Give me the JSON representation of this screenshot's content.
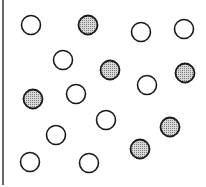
{
  "diagram": {
    "colors": {
      "stroke": "#1a1a1a",
      "open_fill": "#ffffff",
      "filled_fill": "#b0b0b0"
    },
    "circle_radius": 9.5,
    "circles": [
      {
        "x": 31,
        "y": 25,
        "type": "open"
      },
      {
        "x": 88,
        "y": 25,
        "type": "filled"
      },
      {
        "x": 141,
        "y": 32,
        "type": "open"
      },
      {
        "x": 184,
        "y": 29,
        "type": "open"
      },
      {
        "x": 63,
        "y": 60,
        "type": "open"
      },
      {
        "x": 110,
        "y": 70,
        "type": "filled"
      },
      {
        "x": 185,
        "y": 73,
        "type": "filled"
      },
      {
        "x": 33,
        "y": 99,
        "type": "filled"
      },
      {
        "x": 76,
        "y": 94,
        "type": "open"
      },
      {
        "x": 147,
        "y": 85,
        "type": "open"
      },
      {
        "x": 106,
        "y": 120,
        "type": "open"
      },
      {
        "x": 170,
        "y": 127,
        "type": "filled"
      },
      {
        "x": 56,
        "y": 135,
        "type": "open"
      },
      {
        "x": 140,
        "y": 149,
        "type": "filled"
      },
      {
        "x": 30,
        "y": 162,
        "type": "open"
      },
      {
        "x": 89,
        "y": 163,
        "type": "open"
      }
    ],
    "counts": {
      "open": 10,
      "filled": 6
    }
  }
}
